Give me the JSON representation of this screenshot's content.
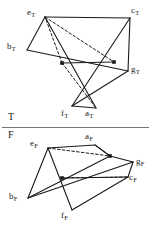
{
  "figure": {
    "divider": {
      "label_above": "T",
      "label_below": "F",
      "y": 127.5,
      "x_start": 2,
      "x_end": 149,
      "color": "#777777"
    },
    "stroke_color": "#1a1a1a",
    "node_color": "#1a1a1a",
    "background": "#ffffff",
    "sections": [
      {
        "name": "top",
        "section_label": "T",
        "vertices": [
          {
            "id": "e_T",
            "base": "e",
            "sub": "T",
            "x": 45,
            "y": 17,
            "label_x": 27,
            "label_y": 8,
            "marked": false
          },
          {
            "id": "c_T",
            "base": "c",
            "sub": "T",
            "x": 130,
            "y": 18,
            "label_x": 131,
            "label_y": 6,
            "marked": false
          },
          {
            "id": "b_T",
            "base": "b",
            "sub": "T",
            "x": 27,
            "y": 50,
            "label_x": 7,
            "label_y": 42,
            "marked": false
          },
          {
            "id": "g_T",
            "base": "g",
            "sub": "T",
            "x": 128,
            "y": 71,
            "label_x": 131,
            "label_y": 65,
            "marked": false
          },
          {
            "id": "f_T",
            "base": "f",
            "sub": "T",
            "x": 72,
            "y": 106,
            "label_x": 61,
            "label_y": 109,
            "marked": false
          },
          {
            "id": "a_T",
            "base": "a",
            "sub": "T",
            "x": 96,
            "y": 108,
            "label_x": 85,
            "label_y": 109,
            "marked": false
          },
          {
            "id": "n1_T",
            "base": "",
            "sub": "",
            "x": 62,
            "y": 63,
            "label_x": null,
            "label_y": null,
            "marked": true
          },
          {
            "id": "n2_T",
            "base": "",
            "sub": "",
            "x": 114,
            "y": 62,
            "label_x": null,
            "label_y": null,
            "marked": true
          }
        ],
        "solid_edges": [
          [
            "e_T",
            "c_T"
          ],
          [
            "e_T",
            "a_T"
          ],
          [
            "c_T",
            "f_T"
          ],
          [
            "b_T",
            "e_T"
          ],
          [
            "b_T",
            "g_T"
          ],
          [
            "g_T",
            "f_T"
          ],
          [
            "g_T",
            "c_T"
          ],
          [
            "n1_T",
            "n2_T"
          ],
          [
            "f_T",
            "a_T"
          ]
        ],
        "dashed_edges": [
          [
            "e_T",
            "n2_T"
          ],
          [
            "n1_T",
            "a_T"
          ],
          [
            "n1_T",
            "e_T"
          ]
        ]
      },
      {
        "name": "bottom",
        "section_label": "F",
        "vertices": [
          {
            "id": "e_F",
            "base": "e",
            "sub": "F",
            "x": 48,
            "y": 148,
            "label_x": 30,
            "label_y": 139,
            "marked": false
          },
          {
            "id": "a_F",
            "base": "a",
            "sub": "F",
            "x": 95,
            "y": 145,
            "label_x": 85,
            "label_y": 132,
            "marked": false
          },
          {
            "id": "g_F",
            "base": "g",
            "sub": "F",
            "x": 133,
            "y": 162,
            "label_x": 136,
            "label_y": 157,
            "marked": false
          },
          {
            "id": "c_F",
            "base": "c",
            "sub": "F",
            "x": 128,
            "y": 177,
            "label_x": 129,
            "label_y": 173,
            "marked": false
          },
          {
            "id": "b_F",
            "base": "b",
            "sub": "F",
            "x": 28,
            "y": 198,
            "label_x": 9,
            "label_y": 192,
            "marked": false
          },
          {
            "id": "f_F",
            "base": "f",
            "sub": "F",
            "x": 72,
            "y": 210,
            "label_x": 61,
            "label_y": 211,
            "marked": false
          },
          {
            "id": "n1_F",
            "base": "",
            "sub": "",
            "x": 110,
            "y": 156,
            "label_x": null,
            "label_y": null,
            "marked": true
          },
          {
            "id": "n2_F",
            "base": "",
            "sub": "",
            "x": 62,
            "y": 178,
            "label_x": null,
            "label_y": null,
            "marked": true
          }
        ],
        "solid_edges": [
          [
            "e_F",
            "a_F"
          ],
          [
            "e_F",
            "b_F"
          ],
          [
            "e_F",
            "f_F"
          ],
          [
            "a_F",
            "n1_F"
          ],
          [
            "n1_F",
            "g_F"
          ],
          [
            "g_F",
            "c_F"
          ],
          [
            "c_F",
            "f_F"
          ],
          [
            "b_F",
            "n1_F"
          ],
          [
            "b_F",
            "g_F"
          ],
          [
            "n2_F",
            "c_F"
          ]
        ],
        "dashed_edges": [
          [
            "a_F",
            "n1_F"
          ],
          [
            "e_F",
            "n1_F"
          ],
          [
            "n2_F",
            "c_F"
          ]
        ]
      }
    ]
  }
}
